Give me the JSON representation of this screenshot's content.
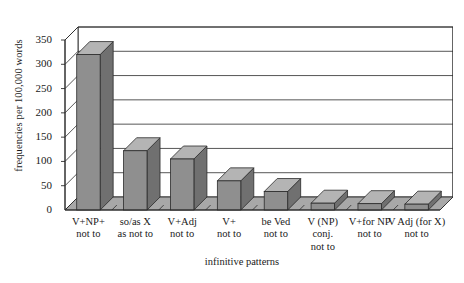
{
  "chart_data": {
    "type": "bar",
    "title": "",
    "xlabel": "infinitive patterns",
    "ylabel": "frequencies per 100,000 words",
    "ylim": [
      0,
      350
    ],
    "ytick_step": 50,
    "ytick_labels": [
      "350",
      "300",
      "250",
      "200",
      "150",
      "100",
      "50",
      "0"
    ],
    "grid": true,
    "legend": "none",
    "style": "3d-column",
    "bar_color": "#8f8f8f",
    "bar_top_color": "#b4b4b4",
    "bar_side_color": "#707070",
    "floor_color": "#a8a8a8",
    "wall_color": "#ffffff",
    "line_color": "#2b2b2b",
    "categories": [
      {
        "lines": [
          "V+NP+",
          "not to"
        ]
      },
      {
        "lines": [
          "so/as X",
          "as not to"
        ]
      },
      {
        "lines": [
          "V+Adj",
          "not to"
        ]
      },
      {
        "lines": [
          "V+",
          "not to"
        ]
      },
      {
        "lines": [
          "be Ved",
          "not to"
        ]
      },
      {
        "lines": [
          "V (NP)",
          "conj.",
          "not to"
        ]
      },
      {
        "lines": [
          "V+for NP",
          "not to"
        ]
      },
      {
        "lines": [
          "V Adj (for X)",
          "not to"
        ]
      }
    ],
    "values": [
      320,
      122,
      105,
      60,
      38,
      14,
      13,
      12
    ]
  }
}
